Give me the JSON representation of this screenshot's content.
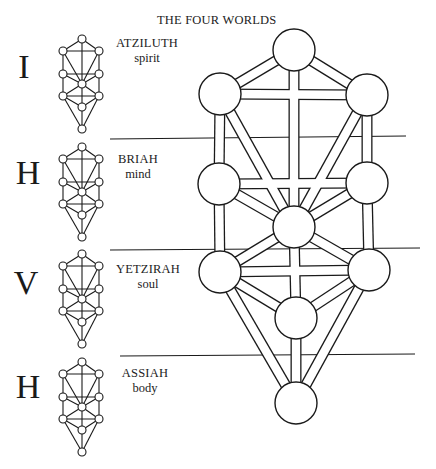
{
  "title": "THE FOUR WORLDS",
  "colors": {
    "ink": "#1a1a1a",
    "paper": "#ffffff"
  },
  "worlds": [
    {
      "letter": "I",
      "name": "ATZILUTH",
      "aspect": "spirit",
      "letter_pos": [
        4,
        50
      ],
      "label_pos": [
        108,
        36
      ],
      "label_width": 78,
      "tree_offset_y": 0,
      "tree_scale_y": 1.0
    },
    {
      "letter": "H",
      "name": "BRIAH",
      "aspect": "mind",
      "letter_pos": [
        8,
        156
      ],
      "label_pos": [
        108,
        152
      ],
      "label_width": 60,
      "tree_offset_y": 108,
      "tree_scale_y": 1.0
    },
    {
      "letter": "V",
      "name": "YETZIRAH",
      "aspect": "soul",
      "letter_pos": [
        6,
        266
      ],
      "label_pos": [
        108,
        262
      ],
      "label_width": 80,
      "tree_offset_y": 215,
      "tree_scale_y": 1.0
    },
    {
      "letter": "H",
      "name": "ASSIAH",
      "aspect": "body",
      "letter_pos": [
        8,
        370
      ],
      "label_pos": [
        114,
        366
      ],
      "label_width": 62,
      "tree_offset_y": 323,
      "tree_scale_y": 1.0
    }
  ],
  "small_tree": {
    "node_radius": 4,
    "nodes": {
      "kether": [
        82,
        39
      ],
      "binah": [
        63,
        51
      ],
      "chokmah": [
        99,
        51
      ],
      "geburah": [
        63,
        74
      ],
      "chesed": [
        99,
        74
      ],
      "tiphareth": [
        82,
        84
      ],
      "hod": [
        63,
        96
      ],
      "netzach": [
        99,
        96
      ],
      "yesod": [
        82,
        107
      ],
      "malkuth": [
        82,
        129
      ]
    }
  },
  "large_tree": {
    "node_radius": 21,
    "channel_width": 11,
    "nodes": {
      "kether": [
        294,
        50
      ],
      "binah": [
        220,
        94
      ],
      "chokmah": [
        367,
        95
      ],
      "geburah": [
        219,
        184
      ],
      "chesed": [
        367,
        183
      ],
      "tiphareth": [
        294,
        227
      ],
      "hod": [
        220,
        272
      ],
      "netzach": [
        369,
        270
      ],
      "yesod": [
        296,
        318
      ],
      "malkuth": [
        296,
        403
      ]
    }
  },
  "paths": [
    [
      "kether",
      "binah"
    ],
    [
      "kether",
      "chokmah"
    ],
    [
      "kether",
      "tiphareth"
    ],
    [
      "binah",
      "chokmah"
    ],
    [
      "binah",
      "geburah"
    ],
    [
      "chokmah",
      "chesed"
    ],
    [
      "binah",
      "tiphareth"
    ],
    [
      "chokmah",
      "tiphareth"
    ],
    [
      "geburah",
      "chesed"
    ],
    [
      "geburah",
      "tiphareth"
    ],
    [
      "chesed",
      "tiphareth"
    ],
    [
      "geburah",
      "hod"
    ],
    [
      "chesed",
      "netzach"
    ],
    [
      "tiphareth",
      "hod"
    ],
    [
      "tiphareth",
      "netzach"
    ],
    [
      "tiphareth",
      "yesod"
    ],
    [
      "hod",
      "netzach"
    ],
    [
      "hod",
      "yesod"
    ],
    [
      "netzach",
      "yesod"
    ],
    [
      "hod",
      "malkuth"
    ],
    [
      "netzach",
      "malkuth"
    ],
    [
      "yesod",
      "malkuth"
    ]
  ],
  "divider_lines": [
    {
      "x1": 110,
      "y1": 139,
      "x2": 406,
      "y2": 136
    },
    {
      "x1": 110,
      "y1": 250,
      "x2": 420,
      "y2": 248
    },
    {
      "x1": 120,
      "y1": 356,
      "x2": 415,
      "y2": 354
    }
  ]
}
